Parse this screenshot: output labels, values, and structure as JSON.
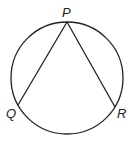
{
  "diagram": {
    "type": "inscribed-angle",
    "circle": {
      "cx": 67,
      "cy": 78,
      "r": 56
    },
    "points": [
      {
        "id": "P",
        "label": "P",
        "x": 67,
        "y": 22
      },
      {
        "id": "Q",
        "label": "Q",
        "x": 18,
        "y": 105
      },
      {
        "id": "R",
        "label": "R",
        "x": 115,
        "y": 107
      }
    ],
    "segments": [
      [
        "P",
        "Q"
      ],
      [
        "P",
        "R"
      ]
    ],
    "stroke_color": "#222222"
  }
}
